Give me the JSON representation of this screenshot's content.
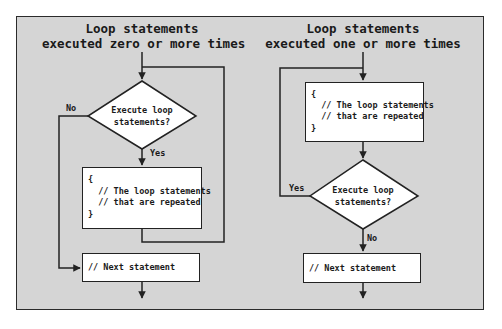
{
  "colors": {
    "page_background": "#ffffff",
    "frame_background": "#d5d5d5",
    "frame_border": "#2b2b2b",
    "box_fill": "#ffffff",
    "line": "#222222"
  },
  "left_flow": {
    "title_line1": "Loop statements",
    "title_line2": "executed zero or more times",
    "decision": {
      "line1": "Execute loop",
      "line2": "statements?"
    },
    "no_label": "No",
    "yes_label": "Yes",
    "loop_box": {
      "lines": [
        "{",
        "  // The loop statements",
        "  // that are repeated",
        "}"
      ]
    },
    "next_box": {
      "text": "// Next statement"
    }
  },
  "right_flow": {
    "title_line1": "Loop statements",
    "title_line2": "executed one or more times",
    "loop_box": {
      "lines": [
        "{",
        "  // The loop statements",
        "  // that are repeated",
        "}"
      ]
    },
    "decision": {
      "line1": "Execute loop",
      "line2": "statements?"
    },
    "yes_label": "Yes",
    "no_label": "No",
    "next_box": {
      "text": "// Next statement"
    }
  }
}
